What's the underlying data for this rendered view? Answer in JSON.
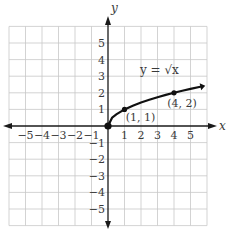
{
  "header": {
    "cut_off_text": "p..."
  },
  "chart_data": {
    "type": "line",
    "title": "",
    "function_label": "y = √x",
    "xlabel": "x",
    "ylabel": "y",
    "xlim": [
      -6,
      6
    ],
    "ylim": [
      -6,
      6
    ],
    "grid": true,
    "x_tick_labels": [
      "−5",
      "−4",
      "−3",
      "−2",
      "−1",
      "1",
      "2",
      "3",
      "4",
      "5"
    ],
    "y_tick_labels": [
      "5",
      "4",
      "3",
      "2",
      "1",
      "−1",
      "−2",
      "−3",
      "−4",
      "−5"
    ],
    "series": [
      {
        "name": "y = √x",
        "x": [
          0,
          0.25,
          0.5,
          1,
          1.5,
          2,
          2.5,
          3,
          3.5,
          4,
          4.5,
          5,
          5.6
        ],
        "y": [
          0,
          0.5,
          0.707,
          1,
          1.225,
          1.414,
          1.581,
          1.732,
          1.871,
          2,
          2.121,
          2.236,
          2.366
        ]
      }
    ],
    "points": [
      {
        "x": 0,
        "y": 0,
        "label": ""
      },
      {
        "x": 1,
        "y": 1,
        "label": "(1, 1)"
      },
      {
        "x": 4,
        "y": 2,
        "label": "(4, 2)"
      }
    ],
    "colors": {
      "grid": "#c8c8c8",
      "axis": "#1a1a1a",
      "curve": "#111111",
      "text": "#3a3a3a"
    }
  }
}
